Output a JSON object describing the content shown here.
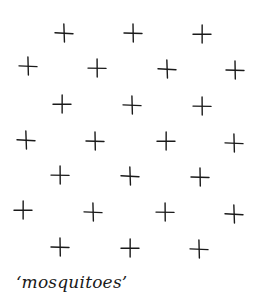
{
  "figure": {
    "caption": "‘mosquitoes’",
    "mark_color": "#1a1a1a",
    "mark_size": 20,
    "marks": [
      {
        "x": 64,
        "y": 33
      },
      {
        "x": 133,
        "y": 33
      },
      {
        "x": 202,
        "y": 34
      },
      {
        "x": 28,
        "y": 66
      },
      {
        "x": 97,
        "y": 68
      },
      {
        "x": 167,
        "y": 69
      },
      {
        "x": 235,
        "y": 70
      },
      {
        "x": 62,
        "y": 104
      },
      {
        "x": 132,
        "y": 105
      },
      {
        "x": 202,
        "y": 106
      },
      {
        "x": 26,
        "y": 140
      },
      {
        "x": 95,
        "y": 141
      },
      {
        "x": 166,
        "y": 141
      },
      {
        "x": 234,
        "y": 143
      },
      {
        "x": 60,
        "y": 175
      },
      {
        "x": 130,
        "y": 176
      },
      {
        "x": 200,
        "y": 177
      },
      {
        "x": 23,
        "y": 210
      },
      {
        "x": 93,
        "y": 212
      },
      {
        "x": 165,
        "y": 212
      },
      {
        "x": 234,
        "y": 214
      },
      {
        "x": 60,
        "y": 247
      },
      {
        "x": 130,
        "y": 248
      },
      {
        "x": 199,
        "y": 249
      }
    ]
  }
}
